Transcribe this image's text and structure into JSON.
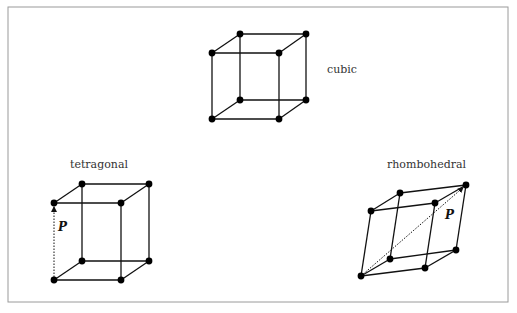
{
  "frame": {
    "x": 8,
    "y": 7,
    "w": 500,
    "h": 295,
    "stroke": "#9a9a9a"
  },
  "colors": {
    "edge": "#111111",
    "vertex": "#000000",
    "label": "#333333"
  },
  "lattices": [
    {
      "id": "cubic",
      "label": "cubic",
      "label_pos": [
        327,
        73
      ],
      "vertices": {
        "btl": [
          240,
          34
        ],
        "btr": [
          306,
          34
        ],
        "ftl": [
          212,
          53
        ],
        "ftr": [
          279,
          53
        ],
        "bbl": [
          240,
          100
        ],
        "bbr": [
          306,
          100
        ],
        "fbl": [
          212,
          119
        ],
        "fbr": [
          279,
          119
        ]
      }
    },
    {
      "id": "tetragonal",
      "label": "tetragonal",
      "label_pos": [
        70,
        168
      ],
      "vertices": {
        "btl": [
          82,
          184
        ],
        "btr": [
          149,
          184
        ],
        "ftl": [
          54,
          203
        ],
        "ftr": [
          121,
          203
        ],
        "bbl": [
          82,
          261
        ],
        "bbr": [
          149,
          261
        ],
        "fbl": [
          54,
          280
        ],
        "fbr": [
          121,
          280
        ]
      },
      "polarization": {
        "label": "P",
        "from": "fbl",
        "to": "ftl",
        "label_pos": [
          58,
          231
        ]
      }
    },
    {
      "id": "rhombohedral",
      "label": "rhombohedral",
      "label_pos": [
        387,
        168
      ],
      "vertices": {
        "btl": [
          400,
          193
        ],
        "btr": [
          466,
          185
        ],
        "ftl": [
          371,
          211
        ],
        "ftr": [
          435,
          203
        ],
        "bbl": [
          390,
          259
        ],
        "bbr": [
          456,
          250
        ],
        "fbl": [
          361,
          276
        ],
        "fbr": [
          425,
          268
        ]
      },
      "polarization": {
        "label": "P",
        "from": "fbl",
        "to": "btr",
        "label_pos": [
          445,
          219
        ]
      }
    }
  ]
}
